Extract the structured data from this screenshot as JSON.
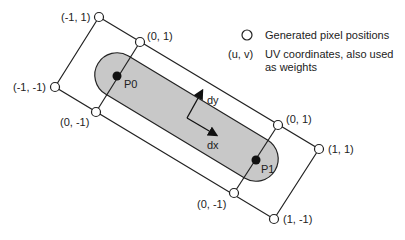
{
  "diagram": {
    "colors": {
      "line": "#222222",
      "fill": "#c8c8c8",
      "point": "#111111",
      "background": "#ffffff"
    },
    "corner_labels": {
      "outer_top_left": "(-1, 1)",
      "inner_top_left": "(0, 1)",
      "outer_bottom_left": "(-1, -1)",
      "inner_bottom_left": "(0, -1)",
      "inner_top_right": "(0, 1)",
      "outer_top_right": "(1, 1)",
      "inner_bottom_right": "(0, -1)",
      "outer_bottom_right": "(1, -1)"
    },
    "points": {
      "p0": "P0",
      "p1": "P1"
    },
    "vectors": {
      "dx": "dx",
      "dy": "dy"
    }
  },
  "legend": {
    "items": [
      {
        "symbol": "circle",
        "symbol_icon": "hollow-circle-icon",
        "text": "Generated pixel positions"
      },
      {
        "symbol": "(u, v)",
        "text": "UV coordinates, also used",
        "text2": "as weights"
      }
    ]
  }
}
